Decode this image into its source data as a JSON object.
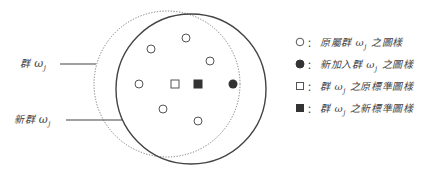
{
  "diagram": {
    "type": "cluster-update-illustration",
    "labels": {
      "old_cluster": {
        "prefix": "群",
        "symbol": "ω",
        "subscript": "j"
      },
      "new_cluster": {
        "prefix": "新群",
        "symbol": "ω",
        "subscript": "j"
      }
    },
    "circles": {
      "old_cluster": {
        "style": "dotted",
        "cx": 167,
        "cy": 84,
        "r": 73,
        "color": "#777777"
      },
      "new_cluster": {
        "style": "solid",
        "cx": 191,
        "cy": 89,
        "r": 75,
        "color": "#444444"
      }
    },
    "leader_lines": [
      {
        "for": "old_cluster",
        "x1": 60,
        "y1": 64,
        "x2": 96,
        "y2": 64
      },
      {
        "for": "new_cluster",
        "x1": 66,
        "y1": 120,
        "x2": 123,
        "y2": 120
      }
    ],
    "points": {
      "original_members": [
        {
          "x": 151,
          "y": 49
        },
        {
          "x": 186,
          "y": 38
        },
        {
          "x": 210,
          "y": 61
        },
        {
          "x": 139,
          "y": 84
        },
        {
          "x": 163,
          "y": 109
        },
        {
          "x": 198,
          "y": 121
        }
      ],
      "new_member": {
        "x": 233,
        "y": 84
      },
      "original_prototype": {
        "x": 175,
        "y": 84
      },
      "new_prototype": {
        "x": 198,
        "y": 84
      }
    }
  },
  "legend": {
    "separator": "：",
    "items": [
      {
        "marker": "open-circle",
        "pre": "原屬群",
        "symbol": "ω",
        "subscript": "j",
        "post": "之圖樣"
      },
      {
        "marker": "filled-circle",
        "pre": "新加入群",
        "symbol": "ω",
        "subscript": "j",
        "post": "之圖樣"
      },
      {
        "marker": "open-square",
        "pre": "群",
        "symbol": "ω",
        "subscript": "j",
        "post": "之原標準圖樣"
      },
      {
        "marker": "filled-square",
        "pre": "群",
        "symbol": "ω",
        "subscript": "j",
        "post": "之新標準圖樣"
      }
    ]
  },
  "colors": {
    "stroke": "#444444",
    "dotted": "#777777",
    "fill": "#333333",
    "marker_stroke": "#555555"
  }
}
